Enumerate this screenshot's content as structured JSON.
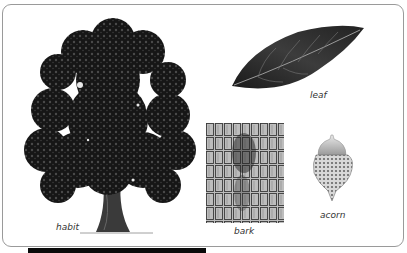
{
  "figure": {
    "labels": {
      "habit": "habit",
      "leaf": "leaf",
      "bark": "bark",
      "acorn": "acorn"
    },
    "colors": {
      "frame_border": "#9a9a9a",
      "ink": "#1a1a1a",
      "bottom_bar": "#0a0a0a"
    }
  }
}
